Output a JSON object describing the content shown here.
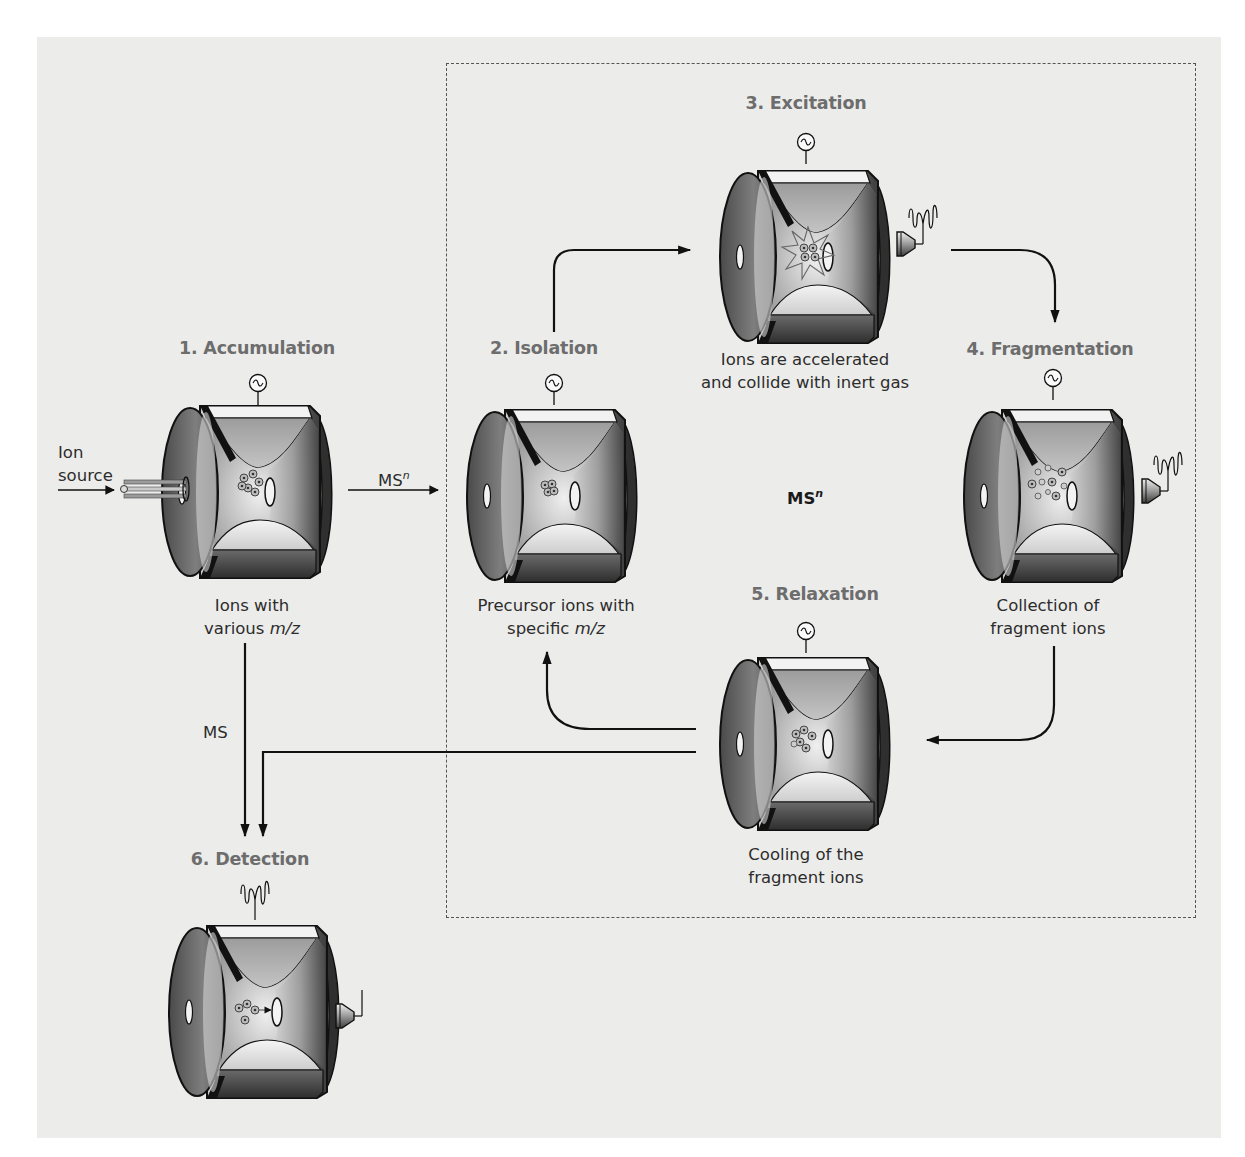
{
  "diagram": {
    "type": "ion-trap-msn-workflow",
    "colors": {
      "background_panel": "#ececeb",
      "title_text": "#6d6d6d",
      "body_text": "#2c2c2c",
      "arrows": "#111111",
      "dashed_box": "#555555",
      "trap_dark": "#3a3a3a",
      "trap_light": "#d8d8d8"
    },
    "steps": [
      {
        "id": "accumulation",
        "title": "1. Accumulation",
        "caption_line1": "Ions with",
        "caption_line2_pre": "various ",
        "caption_line2_italic": "m/z",
        "has_rf_source": true,
        "has_detector": false,
        "ions": "mixed"
      },
      {
        "id": "isolation",
        "title": "2. Isolation",
        "caption_line1": "Precursor ions with",
        "caption_line2_pre": "specific ",
        "caption_line2_italic": "m/z",
        "has_rf_source": true,
        "has_detector": false,
        "ions": "precursor"
      },
      {
        "id": "excitation",
        "title": "3. Excitation",
        "caption_line1": "Ions are accelerated",
        "caption_line2_pre": "and collide with inert gas",
        "caption_line2_italic": "",
        "has_rf_source": true,
        "has_detector": true,
        "ions": "excited"
      },
      {
        "id": "fragmentation",
        "title": "4. Fragmentation",
        "caption_line1": "Collection of",
        "caption_line2_pre": "fragment ions",
        "caption_line2_italic": "",
        "has_rf_source": true,
        "has_detector": true,
        "ions": "fragments"
      },
      {
        "id": "relaxation",
        "title": "5. Relaxation",
        "caption_line1": "Cooling of the",
        "caption_line2_pre": "fragment ions",
        "caption_line2_italic": "",
        "has_rf_source": true,
        "has_detector": false,
        "ions": "cooled"
      },
      {
        "id": "detection",
        "title": "6. Detection",
        "caption_line1": "",
        "caption_line2_pre": "",
        "caption_line2_italic": "",
        "has_rf_source": false,
        "has_detector": true,
        "ions": "ejected"
      }
    ],
    "labels": {
      "ion_source_line1": "Ion",
      "ion_source_line2": "source",
      "msn_arrow_base": "MS",
      "msn_arrow_sup": "n",
      "msn_center_base": "MS",
      "msn_center_sup": "n",
      "ms_arrow": "MS"
    },
    "icons": {
      "rf_source": "ac-sine-circle-icon",
      "detector": "detector-cone-icon",
      "signal": "oscillating-signal-icon"
    }
  }
}
